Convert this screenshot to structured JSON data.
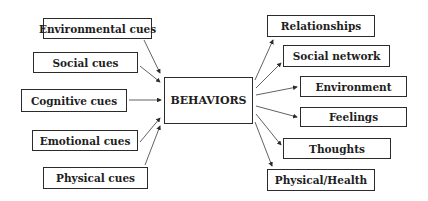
{
  "center": {
    "label": "BEHAVIORS"
  },
  "cues": [
    {
      "label": "Environmental cues"
    },
    {
      "label": "Social cues"
    },
    {
      "label": "Cognitive cues"
    },
    {
      "label": "Emotional cues"
    },
    {
      "label": "Physical cues"
    }
  ],
  "outcomes": [
    {
      "label": "Relationships"
    },
    {
      "label": "Social network"
    },
    {
      "label": "Environment"
    },
    {
      "label": "Feelings"
    },
    {
      "label": "Thoughts"
    },
    {
      "label": "Physical/Health"
    }
  ],
  "colors": {
    "line": "#2b2b2b",
    "text": "#1e1e1e",
    "background": "#ffffff"
  }
}
